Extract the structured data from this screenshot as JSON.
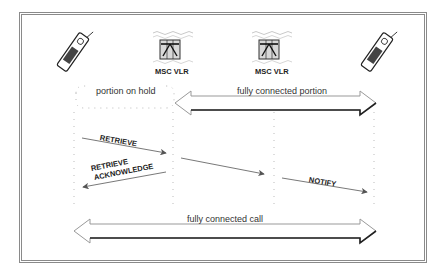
{
  "diagram": {
    "nodes": [
      {
        "id": "mobile-left",
        "icon": "mobile-phone-icon"
      },
      {
        "id": "msc-vlr-1",
        "icon": "switch-icon",
        "label": "MSC VLR"
      },
      {
        "id": "msc-vlr-2",
        "icon": "switch-icon",
        "label": "MSC VLR"
      },
      {
        "id": "mobile-right",
        "icon": "mobile-phone-icon"
      }
    ],
    "regions": {
      "hold": "portion on hold",
      "connected_portion": "fully connected portion",
      "connected_call": "fully connected call"
    },
    "messages": [
      {
        "label": "RETRIEVE",
        "from": "mobile-left",
        "to": "msc-vlr-1"
      },
      {
        "label": "RETRIEVE ACKNOWLEDGE",
        "line1": "RETRIEVE",
        "line2": "ACKNOWLEDGE",
        "from": "msc-vlr-1",
        "to": "mobile-left"
      },
      {
        "label": "",
        "from": "msc-vlr-1",
        "to": "msc-vlr-2"
      },
      {
        "label": "NOTIFY",
        "from": "msc-vlr-2",
        "to": "mobile-right"
      }
    ],
    "colors": {
      "frame": "#8a8a8a",
      "arrow": "#555555",
      "text": "#222222"
    }
  }
}
